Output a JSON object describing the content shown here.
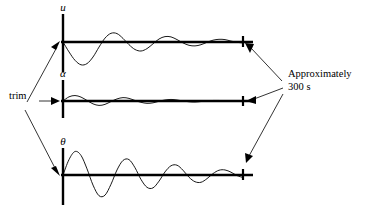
{
  "figure": {
    "title": "",
    "width": 371,
    "height": 212,
    "background_color": "#ffffff",
    "ink_color": "#000000"
  },
  "annotations": {
    "trim_label": "trim",
    "duration_label_line1": "Approximately",
    "duration_label_line2": "300 s"
  },
  "chart_data": {
    "type": "line",
    "title": "",
    "xlabel": "",
    "ylabel": "",
    "grid": false,
    "legend": "none",
    "shared_note": "Three stacked damped-oscillation time responses sharing a common time axis of approximately 300 s, each beginning at the trim condition.",
    "panels": [
      {
        "name": "u",
        "ylabel": "u",
        "ylabel_unicode": "u",
        "start_marker": "trim",
        "end_marker": "Approximately 300 s",
        "xlim": [
          0,
          300
        ],
        "ylim": [
          -1.0,
          1.0
        ],
        "x": [
          0,
          10,
          20,
          30,
          40,
          50,
          60,
          70,
          80,
          90,
          100,
          110,
          120,
          130,
          140,
          150,
          160,
          170,
          180,
          190,
          200,
          210,
          220,
          230,
          240,
          250,
          260,
          270,
          280,
          290,
          300
        ],
        "y": [
          0.0,
          -0.33,
          -0.61,
          -0.76,
          -0.72,
          -0.5,
          -0.17,
          0.13,
          0.29,
          0.28,
          0.12,
          -0.09,
          -0.25,
          -0.3,
          -0.22,
          -0.06,
          0.1,
          0.18,
          0.17,
          0.08,
          -0.03,
          -0.11,
          -0.13,
          -0.09,
          -0.01,
          0.06,
          0.09,
          0.08,
          0.03,
          -0.01,
          -0.03
        ]
      },
      {
        "name": "alpha",
        "ylabel": "α",
        "ylabel_unicode": "α",
        "start_marker": "trim",
        "end_marker": "Approximately 300 s",
        "xlim": [
          0,
          300
        ],
        "ylim": [
          -1.0,
          1.0
        ],
        "x": [
          0,
          10,
          20,
          30,
          40,
          50,
          60,
          70,
          80,
          90,
          100,
          110,
          120,
          130,
          140,
          150,
          160,
          170,
          180,
          190,
          200,
          210,
          220,
          230,
          240,
          250,
          260,
          270,
          280,
          290,
          300
        ],
        "y": [
          0.0,
          0.16,
          0.21,
          0.15,
          0.02,
          -0.11,
          -0.17,
          -0.13,
          -0.02,
          0.08,
          0.13,
          0.1,
          0.02,
          -0.05,
          -0.09,
          -0.07,
          -0.01,
          0.04,
          0.06,
          0.04,
          0.0,
          -0.03,
          -0.04,
          -0.02,
          0.0,
          0.02,
          0.02,
          0.01,
          0.0,
          0.0,
          0.0
        ]
      },
      {
        "name": "theta",
        "ylabel": "θ",
        "ylabel_unicode": "θ",
        "start_marker": "trim",
        "end_marker": "Approximately 300 s",
        "xlim": [
          0,
          300
        ],
        "ylim": [
          -1.0,
          1.0
        ],
        "x": [
          0,
          10,
          20,
          30,
          40,
          50,
          60,
          70,
          80,
          90,
          100,
          110,
          120,
          130,
          140,
          150,
          160,
          170,
          180,
          190,
          200,
          210,
          220,
          230,
          240,
          250,
          260,
          270,
          280,
          290,
          300
        ],
        "y": [
          0.0,
          0.55,
          0.84,
          0.7,
          0.22,
          -0.36,
          -0.74,
          -0.72,
          -0.33,
          0.18,
          0.52,
          0.55,
          0.26,
          -0.16,
          -0.44,
          -0.46,
          -0.22,
          0.11,
          0.33,
          0.35,
          0.17,
          -0.08,
          -0.24,
          -0.26,
          -0.13,
          0.05,
          0.17,
          0.18,
          0.1,
          -0.02,
          -0.09
        ]
      }
    ]
  }
}
